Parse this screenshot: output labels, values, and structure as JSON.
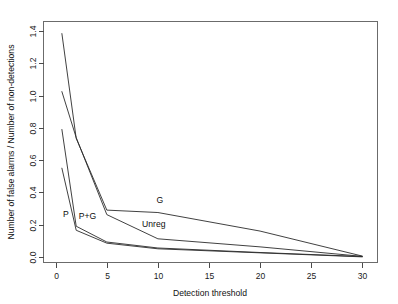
{
  "chart_data": {
    "type": "line",
    "title": "",
    "xlabel": "Detection threshold",
    "ylabel": "Number of false alarms / Number of non-detections",
    "xlim": [
      -1.2,
      31.5
    ],
    "ylim": [
      -0.035,
      1.46
    ],
    "xticks": [
      0,
      5,
      10,
      15,
      20,
      25,
      30
    ],
    "xticklabels": [
      "0",
      "5",
      "10",
      "15",
      "20",
      "25",
      "30"
    ],
    "yticks": [
      0.0,
      0.2,
      0.4,
      0.6,
      0.8,
      1.0,
      1.2,
      1.4
    ],
    "yticklabels": [
      "0.0",
      "0.2",
      "0.4",
      "0.6",
      "0.8",
      "1.0",
      "1.2",
      "1.4"
    ],
    "grid": false,
    "legend": "inline-annotations",
    "series": [
      {
        "name": "G",
        "label": "G",
        "label_x": 10.2,
        "label_y": 0.335,
        "x": [
          0.6,
          2.0,
          5.0,
          10.0,
          20.0,
          30.0
        ],
        "y": [
          1.385,
          0.735,
          0.29,
          0.275,
          0.16,
          0.005
        ]
      },
      {
        "name": "Unreg",
        "label": "Unreg",
        "label_x": 9.6,
        "label_y": 0.188,
        "x": [
          0.6,
          2.0,
          5.0,
          10.0,
          20.0,
          30.0
        ],
        "y": [
          1.025,
          0.74,
          0.262,
          0.112,
          0.062,
          0.003
        ]
      },
      {
        "name": "P",
        "label": "P",
        "label_x": 1.0,
        "label_y": 0.245,
        "x": [
          0.6,
          2.0,
          5.0,
          10.0,
          20.0,
          30.0
        ],
        "y": [
          0.79,
          0.19,
          0.092,
          0.055,
          0.027,
          0.002
        ]
      },
      {
        "name": "P+G",
        "label": "P+G",
        "label_x": 3.1,
        "label_y": 0.232,
        "x": [
          0.6,
          2.0,
          5.0,
          10.0,
          20.0,
          30.0
        ],
        "y": [
          0.55,
          0.165,
          0.085,
          0.05,
          0.025,
          0.0
        ]
      }
    ],
    "colors": {
      "line": "#2b2b2b",
      "axis": "#4a4a4a",
      "frame": "#6b6b6b",
      "background": "#ffffff",
      "text": "#111111"
    }
  }
}
